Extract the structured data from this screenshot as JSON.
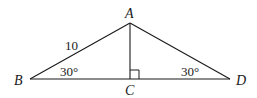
{
  "diagram": {
    "type": "triangle-geometry",
    "points": {
      "A": {
        "label": "A",
        "x": 130,
        "y": 23
      },
      "B": {
        "label": "B",
        "x": 30,
        "y": 79
      },
      "C": {
        "label": "C",
        "x": 130,
        "y": 79
      },
      "D": {
        "label": "D",
        "x": 230,
        "y": 79
      }
    },
    "segments": [
      "AB",
      "AD",
      "BD",
      "AC"
    ],
    "side_label_AB": "10",
    "angle_B": "30°",
    "angle_D": "30°",
    "right_angle_at": "C"
  }
}
